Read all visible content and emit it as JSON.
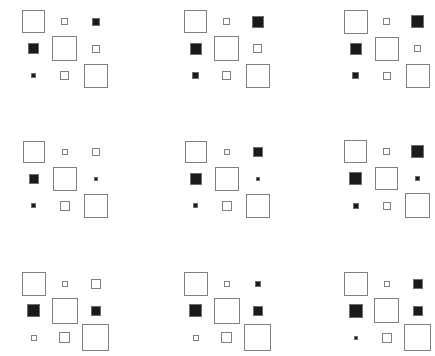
{
  "figure": {
    "title": "",
    "width": 435,
    "height": 356,
    "background": "#ffffff",
    "outline_color": "#808080",
    "fill_color": "#1a1a1a"
  },
  "chart_data": {
    "type": "heatmap",
    "subtype": "hinton-diagram-small-multiples",
    "title": "",
    "xlabel": "",
    "ylabel": "",
    "grid": false,
    "legend": null,
    "encoding": {
      "size": "magnitude",
      "fill": "sign: white/outlined = positive, black/filled = negative"
    },
    "panel_grid": {
      "rows": 3,
      "cols": 3
    },
    "matrix_grid": {
      "rows": 3,
      "cols": 3
    },
    "panel_origins": [
      {
        "x": 8,
        "y": 0
      },
      {
        "x": 170,
        "y": 0
      },
      {
        "x": 330,
        "y": 0
      },
      {
        "x": 8,
        "y": 130
      },
      {
        "x": 170,
        "y": 130
      },
      {
        "x": 330,
        "y": 130
      },
      {
        "x": 8,
        "y": 262
      },
      {
        "x": 170,
        "y": 262
      },
      {
        "x": 330,
        "y": 262
      }
    ],
    "cell_pitch_x": 31,
    "cell_pitch_y": 27,
    "panels": [
      {
        "index": 0,
        "name": "panel-row1-col1",
        "cells": [
          {
            "row": 0,
            "col": 0,
            "size": 23,
            "sign": "positive",
            "value": 1.0
          },
          {
            "row": 0,
            "col": 1,
            "size": 7,
            "sign": "positive",
            "value": 0.09
          },
          {
            "row": 0,
            "col": 2,
            "size": 8,
            "sign": "negative",
            "value": -0.12
          },
          {
            "row": 1,
            "col": 0,
            "size": 11,
            "sign": "negative",
            "value": -0.23
          },
          {
            "row": 1,
            "col": 1,
            "size": 25,
            "sign": "positive",
            "value": 1.18
          },
          {
            "row": 1,
            "col": 2,
            "size": 8,
            "sign": "positive",
            "value": 0.12
          },
          {
            "row": 2,
            "col": 0,
            "size": 5,
            "sign": "negative",
            "value": -0.05
          },
          {
            "row": 2,
            "col": 1,
            "size": 9,
            "sign": "positive",
            "value": 0.15
          },
          {
            "row": 2,
            "col": 2,
            "size": 24,
            "sign": "positive",
            "value": 1.09
          }
        ]
      },
      {
        "index": 1,
        "name": "panel-row1-col2",
        "cells": [
          {
            "row": 0,
            "col": 0,
            "size": 23,
            "sign": "positive",
            "value": 1.0
          },
          {
            "row": 0,
            "col": 1,
            "size": 7,
            "sign": "positive",
            "value": 0.09
          },
          {
            "row": 0,
            "col": 2,
            "size": 12,
            "sign": "negative",
            "value": -0.27
          },
          {
            "row": 1,
            "col": 0,
            "size": 12,
            "sign": "negative",
            "value": -0.27
          },
          {
            "row": 1,
            "col": 1,
            "size": 25,
            "sign": "positive",
            "value": 1.18
          },
          {
            "row": 1,
            "col": 2,
            "size": 9,
            "sign": "positive",
            "value": 0.15
          },
          {
            "row": 2,
            "col": 0,
            "size": 7,
            "sign": "negative",
            "value": -0.09
          },
          {
            "row": 2,
            "col": 1,
            "size": 9,
            "sign": "positive",
            "value": 0.15
          },
          {
            "row": 2,
            "col": 2,
            "size": 24,
            "sign": "positive",
            "value": 1.09
          }
        ]
      },
      {
        "index": 2,
        "name": "panel-row1-col3",
        "cells": [
          {
            "row": 0,
            "col": 0,
            "size": 24,
            "sign": "positive",
            "value": 1.09
          },
          {
            "row": 0,
            "col": 1,
            "size": 7,
            "sign": "positive",
            "value": 0.09
          },
          {
            "row": 0,
            "col": 2,
            "size": 13,
            "sign": "negative",
            "value": -0.32
          },
          {
            "row": 1,
            "col": 0,
            "size": 12,
            "sign": "negative",
            "value": -0.27
          },
          {
            "row": 1,
            "col": 1,
            "size": 24,
            "sign": "positive",
            "value": 1.09
          },
          {
            "row": 1,
            "col": 2,
            "size": 7,
            "sign": "positive",
            "value": 0.09
          },
          {
            "row": 2,
            "col": 0,
            "size": 7,
            "sign": "negative",
            "value": -0.09
          },
          {
            "row": 2,
            "col": 1,
            "size": 8,
            "sign": "positive",
            "value": 0.12
          },
          {
            "row": 2,
            "col": 2,
            "size": 24,
            "sign": "positive",
            "value": 1.09
          }
        ]
      },
      {
        "index": 3,
        "name": "panel-row2-col1",
        "cells": [
          {
            "row": 0,
            "col": 0,
            "size": 22,
            "sign": "positive",
            "value": 0.92
          },
          {
            "row": 0,
            "col": 1,
            "size": 6,
            "sign": "positive",
            "value": 0.07
          },
          {
            "row": 0,
            "col": 2,
            "size": 8,
            "sign": "positive",
            "value": 0.12
          },
          {
            "row": 1,
            "col": 0,
            "size": 10,
            "sign": "negative",
            "value": -0.19
          },
          {
            "row": 1,
            "col": 1,
            "size": 24,
            "sign": "positive",
            "value": 1.09
          },
          {
            "row": 1,
            "col": 2,
            "size": 4,
            "sign": "negative",
            "value": -0.03
          },
          {
            "row": 2,
            "col": 0,
            "size": 5,
            "sign": "negative",
            "value": -0.05
          },
          {
            "row": 2,
            "col": 1,
            "size": 10,
            "sign": "positive",
            "value": 0.19
          },
          {
            "row": 2,
            "col": 2,
            "size": 24,
            "sign": "positive",
            "value": 1.09
          }
        ]
      },
      {
        "index": 4,
        "name": "panel-row2-col2",
        "cells": [
          {
            "row": 0,
            "col": 0,
            "size": 22,
            "sign": "positive",
            "value": 0.92
          },
          {
            "row": 0,
            "col": 1,
            "size": 6,
            "sign": "positive",
            "value": 0.07
          },
          {
            "row": 0,
            "col": 2,
            "size": 10,
            "sign": "negative",
            "value": -0.19
          },
          {
            "row": 1,
            "col": 0,
            "size": 12,
            "sign": "negative",
            "value": -0.27
          },
          {
            "row": 1,
            "col": 1,
            "size": 24,
            "sign": "positive",
            "value": 1.09
          },
          {
            "row": 1,
            "col": 2,
            "size": 4,
            "sign": "negative",
            "value": -0.03
          },
          {
            "row": 2,
            "col": 0,
            "size": 5,
            "sign": "negative",
            "value": -0.05
          },
          {
            "row": 2,
            "col": 1,
            "size": 10,
            "sign": "positive",
            "value": 0.19
          },
          {
            "row": 2,
            "col": 2,
            "size": 24,
            "sign": "positive",
            "value": 1.09
          }
        ]
      },
      {
        "index": 5,
        "name": "panel-row2-col3",
        "cells": [
          {
            "row": 0,
            "col": 0,
            "size": 23,
            "sign": "positive",
            "value": 1.0
          },
          {
            "row": 0,
            "col": 1,
            "size": 7,
            "sign": "positive",
            "value": 0.09
          },
          {
            "row": 0,
            "col": 2,
            "size": 13,
            "sign": "negative",
            "value": -0.32
          },
          {
            "row": 1,
            "col": 0,
            "size": 13,
            "sign": "negative",
            "value": -0.32
          },
          {
            "row": 1,
            "col": 1,
            "size": 23,
            "sign": "positive",
            "value": 1.0
          },
          {
            "row": 1,
            "col": 2,
            "size": 5,
            "sign": "negative",
            "value": -0.05
          },
          {
            "row": 2,
            "col": 0,
            "size": 6,
            "sign": "negative",
            "value": -0.07
          },
          {
            "row": 2,
            "col": 1,
            "size": 8,
            "sign": "positive",
            "value": 0.12
          },
          {
            "row": 2,
            "col": 2,
            "size": 25,
            "sign": "positive",
            "value": 1.18
          }
        ]
      },
      {
        "index": 6,
        "name": "panel-row3-col1",
        "cells": [
          {
            "row": 0,
            "col": 0,
            "size": 24,
            "sign": "positive",
            "value": 1.09
          },
          {
            "row": 0,
            "col": 1,
            "size": 6,
            "sign": "positive",
            "value": 0.07
          },
          {
            "row": 0,
            "col": 2,
            "size": 10,
            "sign": "positive",
            "value": 0.19
          },
          {
            "row": 1,
            "col": 0,
            "size": 13,
            "sign": "negative",
            "value": -0.32
          },
          {
            "row": 1,
            "col": 1,
            "size": 26,
            "sign": "positive",
            "value": 1.28
          },
          {
            "row": 1,
            "col": 2,
            "size": 10,
            "sign": "negative",
            "value": -0.19
          },
          {
            "row": 2,
            "col": 0,
            "size": 6,
            "sign": "positive",
            "value": 0.07
          },
          {
            "row": 2,
            "col": 1,
            "size": 11,
            "sign": "positive",
            "value": 0.23
          },
          {
            "row": 2,
            "col": 2,
            "size": 27,
            "sign": "positive",
            "value": 1.38
          }
        ]
      },
      {
        "index": 7,
        "name": "panel-row3-col2",
        "cells": [
          {
            "row": 0,
            "col": 0,
            "size": 24,
            "sign": "positive",
            "value": 1.09
          },
          {
            "row": 0,
            "col": 1,
            "size": 6,
            "sign": "positive",
            "value": 0.07
          },
          {
            "row": 0,
            "col": 2,
            "size": 6,
            "sign": "negative",
            "value": -0.07
          },
          {
            "row": 1,
            "col": 0,
            "size": 13,
            "sign": "negative",
            "value": -0.32
          },
          {
            "row": 1,
            "col": 1,
            "size": 26,
            "sign": "positive",
            "value": 1.28
          },
          {
            "row": 1,
            "col": 2,
            "size": 10,
            "sign": "negative",
            "value": -0.19
          },
          {
            "row": 2,
            "col": 0,
            "size": 6,
            "sign": "positive",
            "value": 0.07
          },
          {
            "row": 2,
            "col": 1,
            "size": 11,
            "sign": "positive",
            "value": 0.23
          },
          {
            "row": 2,
            "col": 2,
            "size": 27,
            "sign": "positive",
            "value": 1.38
          }
        ]
      },
      {
        "index": 8,
        "name": "panel-row3-col3",
        "cells": [
          {
            "row": 0,
            "col": 0,
            "size": 24,
            "sign": "positive",
            "value": 1.09
          },
          {
            "row": 0,
            "col": 1,
            "size": 6,
            "sign": "positive",
            "value": 0.07
          },
          {
            "row": 0,
            "col": 2,
            "size": 10,
            "sign": "negative",
            "value": -0.19
          },
          {
            "row": 1,
            "col": 0,
            "size": 14,
            "sign": "negative",
            "value": -0.37
          },
          {
            "row": 1,
            "col": 1,
            "size": 25,
            "sign": "positive",
            "value": 1.18
          },
          {
            "row": 1,
            "col": 2,
            "size": 10,
            "sign": "negative",
            "value": -0.19
          },
          {
            "row": 2,
            "col": 0,
            "size": 4,
            "sign": "negative",
            "value": -0.03
          },
          {
            "row": 2,
            "col": 1,
            "size": 10,
            "sign": "positive",
            "value": 0.19
          },
          {
            "row": 2,
            "col": 2,
            "size": 27,
            "sign": "positive",
            "value": 1.38
          }
        ]
      }
    ]
  }
}
